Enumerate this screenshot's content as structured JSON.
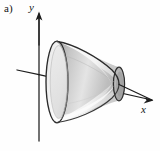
{
  "figure": {
    "part_label": "a)",
    "background_color": "#fefefe",
    "ink_color": "#1a1a1a",
    "axes": {
      "y_axis_label": "y",
      "x_axis_label": "x",
      "y_axis_icon": "vertical-arrow-up-icon",
      "x_axis_icon": "arrow-right-down-icon",
      "origin_x": 39,
      "origin_y": 74
    },
    "surface": {
      "name": "surface-of-revolution",
      "description": "hyperboloid funnel about x-axis",
      "left_rim_cx": 57,
      "left_rim_cy": 82,
      "left_rim_rx": 11,
      "left_rim_ry": 41,
      "right_rim_cx": 119,
      "right_rim_cy": 84,
      "right_rim_rx": 6,
      "right_rim_ry": 17,
      "outer_fill_light": "#ffffff",
      "outer_fill_mid": "#d8d8d8",
      "outer_fill_dark": "#9b9b9b",
      "inner_fill_light": "#f2f2f2",
      "inner_fill_mid": "#cfcfcf",
      "inner_fill_dark": "#a6a6a6",
      "outline_color": "#2b2b2b"
    }
  }
}
